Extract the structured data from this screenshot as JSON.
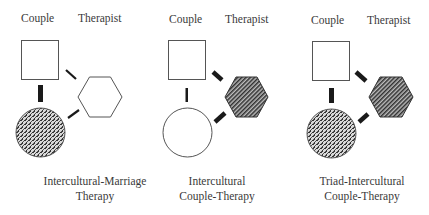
{
  "panels": [
    {
      "couple_label": "Couple",
      "therapist_label": "Therapist",
      "caption_line1": "Intercultural-Marriage",
      "caption_line2": "Therapy",
      "couple_partner_a": "square-outline",
      "couple_partner_b": "circle-stippled",
      "therapist": "hexagon-outline",
      "couple_link": "thick",
      "therapist_links": "thin"
    },
    {
      "couple_label": "Couple",
      "therapist_label": "Therapist",
      "caption_line1": "Intercultural",
      "caption_line2": "Couple-Therapy",
      "couple_partner_a": "square-outline",
      "couple_partner_b": "circle-outline",
      "therapist": "hexagon-hatched",
      "couple_link": "thin",
      "therapist_links": "thick"
    },
    {
      "couple_label": "Couple",
      "therapist_label": "Therapist",
      "caption_line1": "Triad-Intercultural",
      "caption_line2": "Couple-Therapy",
      "couple_partner_a": "square-outline",
      "couple_partner_b": "circle-stippled",
      "therapist": "hexagon-hatched",
      "couple_link": "thick",
      "therapist_links": "thick"
    }
  ],
  "colors": {
    "stroke": "#555555",
    "link": "#1a1a1a",
    "stipple_bg": "#9a9a9a",
    "hatch_bg": "#8a8a8a"
  }
}
